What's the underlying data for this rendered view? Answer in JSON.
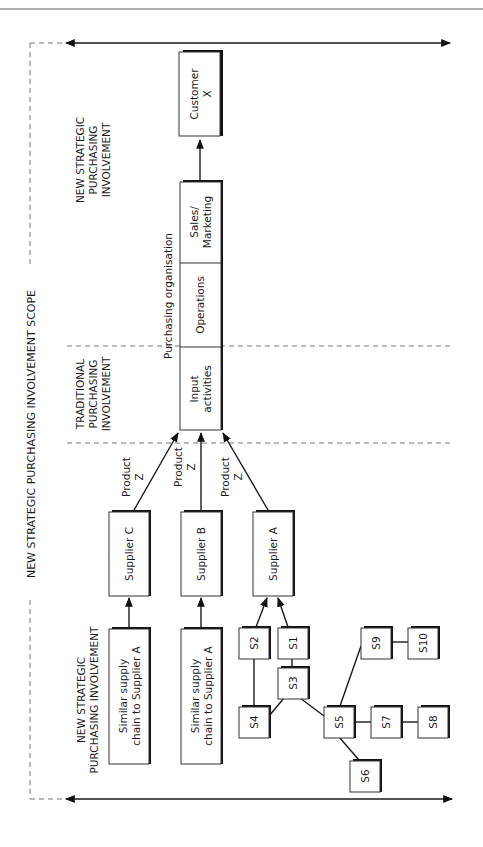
{
  "header_rule": true,
  "scope_label": "NEW STRATEGIC PURCHASING INVOLVEMENT SCOPE",
  "zones": {
    "top_label": [
      "NEW STRATEGIC",
      "PURCHASING",
      "INVOLVEMENT"
    ],
    "middle_label": [
      "TRADITIONAL",
      "PURCHASING",
      "INVOLVEMENT"
    ],
    "bottom_label": [
      "NEW STRATEGIC",
      "PURCHASING INVOLVEMENT"
    ]
  },
  "organisation": {
    "title": "Purchasing organisation",
    "sections": [
      {
        "id": "sales",
        "lines": [
          "Sales/",
          "Marketing"
        ]
      },
      {
        "id": "operations",
        "lines": [
          "Operations"
        ]
      },
      {
        "id": "input",
        "lines": [
          "Input",
          "activities"
        ]
      }
    ]
  },
  "customer": {
    "lines": [
      "Customer",
      "X"
    ]
  },
  "suppliers": [
    {
      "id": "supplier-c",
      "label": "Supplier C",
      "flow_label": [
        "Product",
        "Z"
      ]
    },
    {
      "id": "supplier-b",
      "label": "Supplier B",
      "flow_label": [
        "Product",
        "Z"
      ]
    },
    {
      "id": "supplier-a",
      "label": "Supplier A",
      "flow_label": [
        "Product",
        "Z"
      ]
    }
  ],
  "similar_chains": [
    {
      "id": "chain-c",
      "lines": [
        "Similar supply",
        "chain to Supplier A"
      ]
    },
    {
      "id": "chain-b",
      "lines": [
        "Similar supply",
        "chain to Supplier A"
      ]
    }
  ],
  "network_nodes": [
    "S1",
    "S2",
    "S3",
    "S4",
    "S5",
    "S6",
    "S7",
    "S8",
    "S9",
    "S10"
  ],
  "network_edges": [
    [
      "S2",
      "Supplier A"
    ],
    [
      "S1",
      "Supplier A"
    ],
    [
      "S2",
      "S4"
    ],
    [
      "S1",
      "S3"
    ],
    [
      "S3",
      "S4"
    ],
    [
      "S3",
      "S5"
    ],
    [
      "S5",
      "S9"
    ],
    [
      "S9",
      "S10"
    ],
    [
      "S5",
      "S7"
    ],
    [
      "S7",
      "S8"
    ],
    [
      "S5",
      "S6"
    ]
  ]
}
